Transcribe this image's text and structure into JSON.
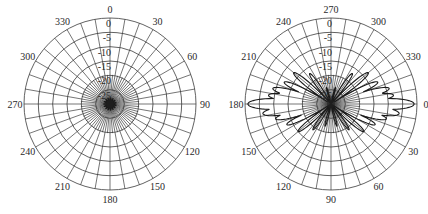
{
  "chart_data": [
    {
      "type": "polar",
      "title": "",
      "angular_unit": "degrees",
      "radial_unit": "dB",
      "radial_range": [
        -30,
        0
      ],
      "radial_ticks": [
        0,
        -5,
        -10,
        -15,
        -20,
        -25
      ],
      "angular_grid_step": 10,
      "angular_tick_labels": [
        {
          "angle_pos": 0,
          "label": "0"
        },
        {
          "angle_pos": 30,
          "label": "30"
        },
        {
          "angle_pos": 60,
          "label": "60"
        },
        {
          "angle_pos": 90,
          "label": "90"
        },
        {
          "angle_pos": 120,
          "label": "120"
        },
        {
          "angle_pos": 150,
          "label": "150"
        },
        {
          "angle_pos": 180,
          "label": "180"
        },
        {
          "angle_pos": 210,
          "label": "210"
        },
        {
          "angle_pos": 240,
          "label": "240"
        },
        {
          "angle_pos": 270,
          "label": "270"
        },
        {
          "angle_pos": 300,
          "label": "300"
        },
        {
          "angle_pos": 330,
          "label": "330"
        }
      ],
      "orientation": "0 at top, clockwise",
      "series": [
        {
          "name": "pattern",
          "description": "Near-null response, all values at or below about -28 dB (clustered at center)",
          "theta": [
            0,
            30,
            60,
            90,
            120,
            150,
            180,
            210,
            240,
            270,
            300,
            330
          ],
          "r_db": [
            -29,
            -29,
            -29,
            -29,
            -29,
            -29,
            -29,
            -29,
            -29,
            -29,
            -29,
            -29
          ]
        }
      ],
      "grid": true,
      "legend": null
    },
    {
      "type": "polar",
      "title": "",
      "angular_unit": "degrees",
      "radial_unit": "dB",
      "radial_range": [
        -30,
        0
      ],
      "radial_ticks": [
        0,
        -5,
        -10,
        -15,
        -20,
        -25
      ],
      "angular_grid_step": 10,
      "angular_tick_labels": [
        {
          "angle_pos": 0,
          "label": "270"
        },
        {
          "angle_pos": 30,
          "label": "300"
        },
        {
          "angle_pos": 60,
          "label": "330"
        },
        {
          "angle_pos": 90,
          "label": "0"
        },
        {
          "angle_pos": 120,
          "label": "30"
        },
        {
          "angle_pos": 150,
          "label": "60"
        },
        {
          "angle_pos": 180,
          "label": "90"
        },
        {
          "angle_pos": 210,
          "label": "120"
        },
        {
          "angle_pos": 240,
          "label": "150"
        },
        {
          "angle_pos": 270,
          "label": "180"
        },
        {
          "angle_pos": 300,
          "label": "210"
        },
        {
          "angle_pos": 330,
          "label": "240"
        }
      ],
      "orientation": "0 at right (east), 270 at top",
      "series": [
        {
          "name": "pattern",
          "description": "Multi-lobe radiation pattern: main lobes toward 0 and 180 reaching ~0 dB; side lobes between -4 and -22 dB",
          "lobes": [
            {
              "theta": 0,
              "peak_db": -1
            },
            {
              "theta": 180,
              "peak_db": -1
            },
            {
              "theta": 8,
              "peak_db": -6
            },
            {
              "theta": 352,
              "peak_db": -8
            },
            {
              "theta": 172,
              "peak_db": -6
            },
            {
              "theta": 188,
              "peak_db": -8
            },
            {
              "theta": 15,
              "peak_db": -10
            },
            {
              "theta": 345,
              "peak_db": -9
            },
            {
              "theta": 165,
              "peak_db": -10
            },
            {
              "theta": 195,
              "peak_db": -9
            },
            {
              "theta": 25,
              "peak_db": -13
            },
            {
              "theta": 335,
              "peak_db": -12
            },
            {
              "theta": 155,
              "peak_db": -13
            },
            {
              "theta": 205,
              "peak_db": -12
            },
            {
              "theta": 40,
              "peak_db": -15
            },
            {
              "theta": 320,
              "peak_db": -13
            },
            {
              "theta": 140,
              "peak_db": -15
            },
            {
              "theta": 220,
              "peak_db": -13
            },
            {
              "theta": 55,
              "peak_db": -19
            },
            {
              "theta": 305,
              "peak_db": -17
            },
            {
              "theta": 125,
              "peak_db": -19
            },
            {
              "theta": 235,
              "peak_db": -17
            },
            {
              "theta": 75,
              "peak_db": -22
            },
            {
              "theta": 105,
              "peak_db": -22
            },
            {
              "theta": 285,
              "peak_db": -24
            },
            {
              "theta": 255,
              "peak_db": -24
            }
          ],
          "null_db": -30
        }
      ],
      "grid": true,
      "legend": null
    }
  ],
  "charts": {
    "left": {
      "radial_labels": [
        "0",
        "-5",
        "-10",
        "-15",
        "-20",
        "-25"
      ],
      "angle_labels": [
        "0",
        "30",
        "60",
        "90",
        "120",
        "150",
        "180",
        "210",
        "240",
        "270",
        "300",
        "330"
      ]
    },
    "right": {
      "radial_labels": [
        "0",
        "-5",
        "-10",
        "-15",
        "-20",
        "-25"
      ],
      "angle_labels": [
        "270",
        "300",
        "330",
        "0",
        "30",
        "60",
        "90",
        "120",
        "150",
        "180",
        "210",
        "240"
      ]
    }
  }
}
